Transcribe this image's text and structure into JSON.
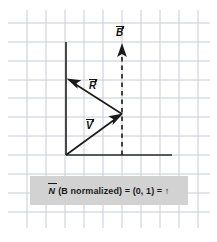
{
  "figure": {
    "background_color": "#ffffff",
    "grid": {
      "visible": true,
      "line_color": "#c9ccd6",
      "spacing_px": 19,
      "x_start_px": 27,
      "y_start_px": 23,
      "x_end_px": 198,
      "y_end_px": 228
    }
  },
  "axes": {
    "origin_label": "origin",
    "vertical_axis": {
      "x": 66,
      "y_top": 42,
      "y_bottom": 155,
      "color": "#2b2b2b"
    },
    "horizontal_axis": {
      "y": 155,
      "x_left": 66,
      "x_right": 172,
      "color": "#2b2b2b"
    }
  },
  "vectors": [
    {
      "name": "B",
      "label": "B",
      "style": "dashed",
      "color": "#1a1a1a",
      "start": [
        122,
        155
      ],
      "end": [
        122,
        44
      ],
      "label_position": [
        116,
        27
      ],
      "description": "dashed vertical vector pointing up"
    },
    {
      "name": "R",
      "label": "R",
      "style": "solid",
      "color": "#1a1a1a",
      "start": [
        122,
        114
      ],
      "end": [
        67,
        79
      ],
      "label_position": [
        89,
        80
      ],
      "description": "solid vector pointing up-left"
    },
    {
      "name": "V",
      "label": "V",
      "style": "solid",
      "color": "#1a1a1a",
      "start": [
        66,
        155
      ],
      "end": [
        122,
        114
      ],
      "label_position": [
        86,
        120
      ],
      "description": "solid vector pointing up-right from origin"
    }
  ],
  "caption": {
    "background_color": "#d2d2d2",
    "text_color": "#1a1a1a",
    "vector_symbol": "N",
    "rest": "(B normalized) = (0, 1) = ↑",
    "full_text": "N (B normalized) = (0, 1) = ↑"
  },
  "labels": {
    "B": "B",
    "R": "R",
    "V": "V"
  }
}
